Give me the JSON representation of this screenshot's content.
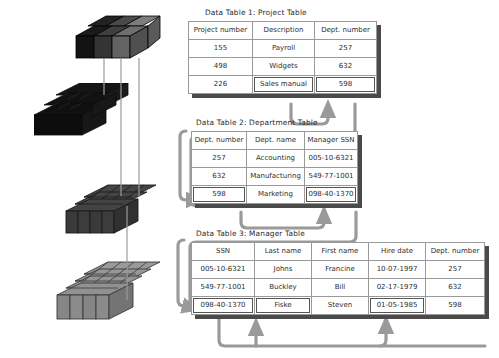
{
  "diagram": {
    "title_prefix": "Data Table",
    "tables": [
      {
        "id": "project-table",
        "caption": "Data Table 1: Project Table",
        "columns": [
          "Project number",
          "Description",
          "Dept. number"
        ],
        "rows": [
          [
            "155",
            "Payroll",
            "257"
          ],
          [
            "498",
            "Widgets",
            "632"
          ],
          [
            "226",
            "Sales manual",
            "598"
          ]
        ],
        "highlighted_cells": [
          [
            2,
            1
          ],
          [
            2,
            2
          ]
        ]
      },
      {
        "id": "department-table",
        "caption": "Data Table 2: Department Table",
        "columns": [
          "Dept. number",
          "Dept. name",
          "Manager SSN"
        ],
        "rows": [
          [
            "257",
            "Accounting",
            "005-10-6321"
          ],
          [
            "632",
            "Manufacturing",
            "549-77-1001"
          ],
          [
            "598",
            "Marketing",
            "098-40-1370"
          ]
        ],
        "highlighted_cells": [
          [
            2,
            0
          ],
          [
            2,
            2
          ]
        ]
      },
      {
        "id": "manager-table",
        "caption": "Data Table 3: Manager Table",
        "columns": [
          "SSN",
          "Last name",
          "First name",
          "Hire date",
          "Dept. number"
        ],
        "rows": [
          [
            "005-10-6321",
            "Johns",
            "Francine",
            "10-07-1997",
            "257"
          ],
          [
            "549-77-1001",
            "Buckley",
            "Bill",
            "02-17-1979",
            "632"
          ],
          [
            "098-40-1370",
            "Fiske",
            "Steven",
            "01-05-1985",
            "598"
          ]
        ],
        "highlighted_cells": [
          [
            2,
            0
          ],
          [
            2,
            1
          ],
          [
            2,
            3
          ]
        ]
      }
    ],
    "blocks": [
      {
        "id": "block-top",
        "rows": 2,
        "cols": 3,
        "shades": [
          "#1d1d1d",
          "#3a3a3a",
          "#6e6e6e"
        ]
      },
      {
        "id": "block-second",
        "rows": 2,
        "cols": 4,
        "shades": [
          "#141414",
          "#141414",
          "#141414",
          "#141414"
        ]
      },
      {
        "id": "block-third",
        "rows": 3,
        "cols": 4,
        "shades": [
          "#3d3d3d",
          "#3d3d3d",
          "#3d3d3d",
          "#3d3d3d"
        ]
      },
      {
        "id": "block-bottom",
        "rows": 4,
        "cols": 4,
        "shades": [
          "#8c8c8c",
          "#8c8c8c",
          "#8c8c8c",
          "#8c8c8c"
        ]
      }
    ],
    "colors": {
      "connector": "#9a9a9a",
      "table_border": "#9a9a9a",
      "table_shadow": "#4a4a4a",
      "highlight_outline": "#555555",
      "text": "#2e2e2e",
      "background": "#ffffff"
    },
    "connectors": [
      {
        "id": "project-to-department",
        "from": "Project Table Sales manual / 598",
        "to": "Project Table 598",
        "style": "loop-up-arrow"
      },
      {
        "id": "department-598-in",
        "from": "left bracket",
        "to": "Department Table 598",
        "style": "left-bracket-arrow"
      },
      {
        "id": "department-to-manager",
        "from": "Department Table 098-40-1370",
        "to": "Department Table 098-40-1370",
        "style": "loop-up-arrow"
      },
      {
        "id": "manager-ssn-in",
        "from": "left bracket",
        "to": "Manager Table 098-40-1370",
        "style": "left-bracket-arrow"
      },
      {
        "id": "manager-lastname-in",
        "from": "bottom bus",
        "to": "Manager Table Fiske",
        "style": "up-arrow"
      },
      {
        "id": "manager-hiredate-in",
        "from": "bottom bus",
        "to": "Manager Table 01-05-1985",
        "style": "up-arrow"
      }
    ]
  }
}
